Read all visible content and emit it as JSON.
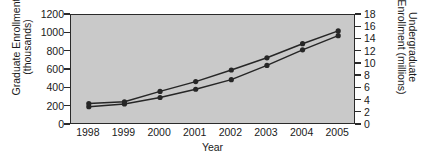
{
  "chart_data": {
    "type": "line",
    "title": "",
    "xlabel": "Year",
    "ylabel": "Graduate Enrollment (thousands)",
    "ylabel_line1": "Graduate Enrollment",
    "ylabel_line2": "(thousands)",
    "ylabel_right": "Undergraduate Enrollment (millions)",
    "ylabel_right_line1": "Undergraduate",
    "ylabel_right_line2": "Enrollment (millions)",
    "categories": [
      "1998",
      "1999",
      "2000",
      "2001",
      "2002",
      "2003",
      "2004",
      "2005"
    ],
    "x": [
      1998,
      1999,
      2000,
      2001,
      2002,
      2003,
      2004,
      2005
    ],
    "ylim": [
      0,
      1200
    ],
    "yticks": [
      0,
      200,
      400,
      600,
      800,
      1000,
      1200
    ],
    "ytick_labels": [
      "0",
      "200",
      "400",
      "600",
      "800",
      "1000",
      "1200"
    ],
    "ylim_right": [
      0,
      18
    ],
    "yticks_right": [
      0,
      2,
      4,
      6,
      8,
      10,
      12,
      14,
      16,
      18
    ],
    "ytick_labels_right": [
      "0",
      "2",
      "4",
      "6",
      "8",
      "10",
      "12",
      "14",
      "16",
      "18"
    ],
    "grid": false,
    "legend": "none",
    "plot_background": "#c9c9c9",
    "line_color": "#262626",
    "marker": "circle",
    "series": [
      {
        "name": "Graduate Enrollment (thousands)",
        "axis": "left",
        "units": "thousands",
        "values": [
          200,
          230,
          300,
          390,
          495,
          650,
          820,
          975
        ]
      },
      {
        "name": "Undergraduate Enrollment (millions)",
        "axis": "right",
        "units": "millions",
        "values": [
          3.5,
          3.8,
          5.5,
          7.1,
          9.0,
          11.0,
          13.3,
          15.4
        ]
      }
    ]
  }
}
